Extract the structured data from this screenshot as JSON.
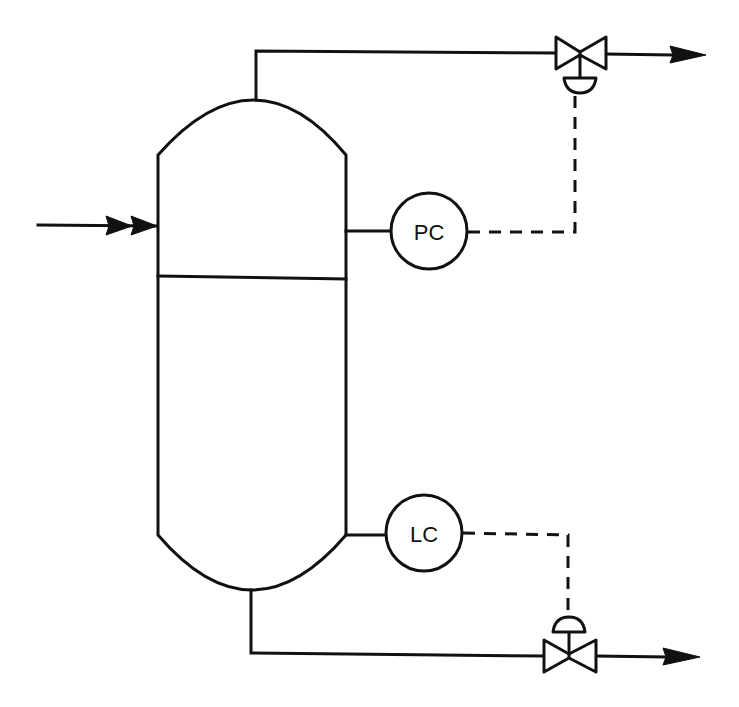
{
  "diagram": {
    "type": "process-flow-diagram",
    "colors": {
      "line": "#111111",
      "background": "#ffffff"
    },
    "vessel": {
      "name": "separator-vessel",
      "has_liquid_level_line": true
    },
    "streams": [
      {
        "name": "feed-inlet",
        "direction": "into vessel (left side)"
      },
      {
        "name": "vapor-outlet",
        "direction": "top nozzle to right, through pressure control valve"
      },
      {
        "name": "liquid-outlet",
        "direction": "bottom nozzle to right, through level control valve"
      }
    ],
    "instruments": [
      {
        "id": "pc",
        "label": "PC",
        "meaning": "Pressure Controller",
        "controls": "vapor-outlet-valve"
      },
      {
        "id": "lc",
        "label": "LC",
        "meaning": "Level Controller",
        "controls": "liquid-outlet-valve"
      }
    ],
    "valves": [
      {
        "name": "vapor-outlet-valve",
        "actuator": "diaphragm"
      },
      {
        "name": "liquid-outlet-valve",
        "actuator": "diaphragm"
      }
    ]
  }
}
